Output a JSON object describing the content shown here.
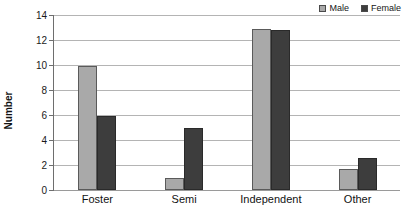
{
  "chart_data": {
    "type": "bar",
    "title": "",
    "xlabel": "",
    "ylabel": "Number",
    "categories": [
      "Foster",
      "Semi",
      "Independent",
      "Other"
    ],
    "series": [
      {
        "name": "Male",
        "values": [
          9.9,
          1.0,
          12.9,
          1.7
        ],
        "color": "#a9a9a9"
      },
      {
        "name": "Female",
        "values": [
          5.9,
          5.0,
          12.8,
          2.6
        ],
        "color": "#3d3d3d"
      }
    ],
    "ylim": [
      0,
      14
    ],
    "ytick_labels": [
      "14",
      "12",
      "10",
      "8",
      "6",
      "4",
      "2",
      "0"
    ],
    "ytick_values": [
      14,
      12,
      10,
      8,
      6,
      4,
      2,
      0
    ],
    "grid": true,
    "legend_position": "top-right"
  },
  "legend": {
    "entries": [
      {
        "label": "Male"
      },
      {
        "label": "Female"
      }
    ]
  },
  "axes": {
    "y_title": "Number"
  }
}
